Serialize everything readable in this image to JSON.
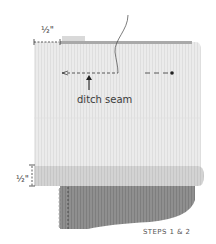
{
  "diagram": {
    "top_measure": {
      "label": "½\""
    },
    "seam_callout": {
      "label": "ditch seam"
    },
    "side_measure": {
      "label": "½\""
    },
    "caption": "STEPS 1 & 2"
  },
  "colors": {
    "panel_light": "#e9e9e9",
    "panel_stripe": "#dcdcdc",
    "top_edge": "#a9a9a9",
    "band": "#d0d0d0",
    "dark_panel": "#8d8d8d",
    "dark_stripe": "#7c7c7c",
    "line": "#333333"
  }
}
